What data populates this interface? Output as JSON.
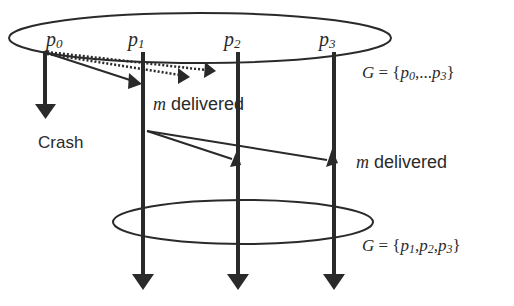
{
  "diagram": {
    "processes": [
      {
        "id": "p0",
        "label": "p",
        "sub": "0"
      },
      {
        "id": "p1",
        "label": "p",
        "sub": "1"
      },
      {
        "id": "p2",
        "label": "p",
        "sub": "2"
      },
      {
        "id": "p3",
        "label": "p",
        "sub": "3"
      }
    ],
    "crash_label": "Crash",
    "message_var": "m",
    "delivered_text": " delivered",
    "group_top": {
      "G": "G",
      "eq": " = {",
      "p_a": "p",
      "sub_a": "0",
      "dots": ",...",
      "p_b": "p",
      "sub_b": "3",
      "close": "}"
    },
    "group_bottom": {
      "G": "G",
      "eq": " = {",
      "p_a": "p",
      "sub_a": "1",
      "comma1": ",",
      "p_b": "p",
      "sub_b": "2",
      "comma2": ",",
      "p_c": "p",
      "sub_c": "3",
      "close": "}"
    },
    "colors": {
      "ink": "#2a2a2a",
      "background": "#ffffff"
    }
  }
}
